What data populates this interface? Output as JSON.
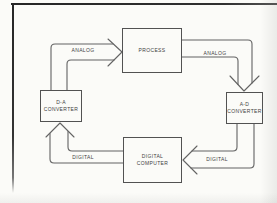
{
  "diagram": {
    "nodes": {
      "process": {
        "label": "PROCESS"
      },
      "ad_converter": {
        "label": "A-D\nCONVERTER"
      },
      "digital_computer": {
        "label": "DIGITAL\nCOMPUTER"
      },
      "da_converter": {
        "label": "D-A\nCONVERTER"
      }
    },
    "edges": {
      "da_to_process": {
        "label": "ANALOG",
        "from": "D-A CONVERTER",
        "to": "PROCESS"
      },
      "process_to_ad": {
        "label": "ANALOG",
        "from": "PROCESS",
        "to": "A-D CONVERTER"
      },
      "ad_to_computer": {
        "label": "DIGITAL",
        "from": "A-D CONVERTER",
        "to": "DIGITAL COMPUTER"
      },
      "computer_to_da": {
        "label": "DIGITAL",
        "from": "DIGITAL COMPUTER",
        "to": "D-A CONVERTER"
      }
    },
    "colors": {
      "paper": "#fbfbf8",
      "line": "#636363",
      "box_border": "#525252",
      "text": "#3f3f3f",
      "page_frame": "#2a2a2a"
    }
  }
}
